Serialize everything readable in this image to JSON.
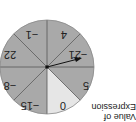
{
  "caption": {
    "line1": "Value of",
    "line2": "Expression"
  },
  "spinner": {
    "orientation": "rotated-180",
    "sectors": [
      {
        "label": "5",
        "color": "#a9a9a9"
      },
      {
        "label": "0",
        "color": "#e6e6e6"
      },
      {
        "label": "−15",
        "color": "#a9a9a9"
      },
      {
        "label": "−8",
        "color": "#a9a9a9"
      },
      {
        "label": "22",
        "color": "#a9a9a9"
      },
      {
        "label": "−1",
        "color": "#a9a9a9"
      },
      {
        "label": "4",
        "color": "#a9a9a9"
      },
      {
        "label": "−21",
        "color": "#a9a9a9"
      }
    ],
    "arrow_points_to": "−21"
  }
}
